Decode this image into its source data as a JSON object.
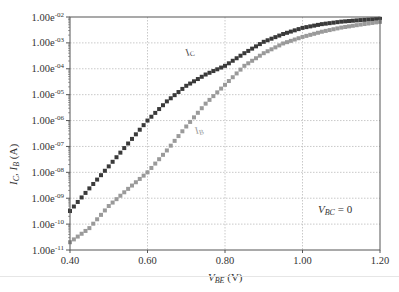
{
  "chart_data": {
    "type": "scatter",
    "title": "",
    "xlabel": "V_BE (V)",
    "ylabel": "I_C, I_B (A)",
    "xscale": "linear",
    "yscale": "log",
    "xlim": [
      0.4,
      1.2
    ],
    "ylim": [
      1e-11,
      0.01
    ],
    "x_ticks": [
      "0.40",
      "0.60",
      "0.80",
      "1.00",
      "1.20"
    ],
    "y_ticks": [
      "1.00e-11",
      "1.00e-10",
      "1.00e-09",
      "1.00e-08",
      "1.00e-07",
      "1.00e-06",
      "1.00e-05",
      "1.00e-04",
      "1.00e-03",
      "1.00e-02"
    ],
    "grid": true,
    "annotation": "V_BC = 0",
    "series": [
      {
        "name": "I_C",
        "label": "I_C",
        "color": "#3a3a3a",
        "marker": "square",
        "x": [
          0.4,
          0.45,
          0.5,
          0.55,
          0.6,
          0.65,
          0.7,
          0.75,
          0.8,
          0.85,
          0.9,
          0.95,
          1.0,
          1.05,
          1.1,
          1.15,
          1.2
        ],
        "y": [
          3.2e-10,
          2.4e-09,
          1.7e-08,
          1.3e-07,
          1e-06,
          5.5e-06,
          2.2e-05,
          6e-05,
          0.00013,
          0.0004,
          0.0011,
          0.0022,
          0.0038,
          0.0053,
          0.0066,
          0.0076,
          0.0085
        ]
      },
      {
        "name": "I_B",
        "label": "I_B",
        "color": "#9a9a9a",
        "marker": "square",
        "x": [
          0.4,
          0.45,
          0.5,
          0.55,
          0.6,
          0.65,
          0.7,
          0.75,
          0.8,
          0.85,
          0.9,
          0.95,
          1.0,
          1.05,
          1.1,
          1.15,
          1.2
        ],
        "y": [
          2e-11,
          7e-11,
          5e-10,
          2.3e-09,
          1e-08,
          7e-08,
          5.9e-07,
          4.5e-06,
          2.4e-05,
          0.00013,
          0.0004,
          0.00095,
          0.0017,
          0.0027,
          0.0039,
          0.0051,
          0.0065
        ]
      }
    ]
  },
  "labels": {
    "x_axis_main": "V",
    "x_axis_sub": "BE",
    "x_axis_unit": " (V)",
    "y_axis_ic": "I",
    "y_axis_ic_sub": "C",
    "y_axis_sep": ", ",
    "y_axis_ib": "I",
    "y_axis_ib_sub": "B",
    "y_axis_unit": " (A)",
    "curve_ic": "I",
    "curve_ic_sub": "C",
    "curve_ib": "I",
    "curve_ib_sub": "B",
    "annotation_main": "V",
    "annotation_sub": "BC",
    "annotation_rest": " = 0"
  }
}
